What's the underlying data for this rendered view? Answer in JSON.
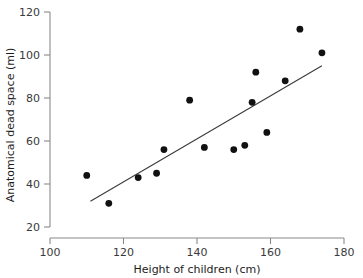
{
  "chart_data": {
    "type": "scatter",
    "title": "",
    "xlabel": "Height of children (cm)",
    "ylabel": "Anatomical dead space (ml)",
    "xlim": [
      100,
      180
    ],
    "ylim": [
      20,
      120
    ],
    "xticks": [
      100,
      120,
      140,
      160,
      180
    ],
    "yticks": [
      20,
      40,
      60,
      80,
      100,
      120
    ],
    "xtick_labels": [
      "100",
      "120",
      "140",
      "160",
      "180"
    ],
    "ytick_labels": [
      "20",
      "40",
      "60",
      "80",
      "100",
      "120"
    ],
    "grid": false,
    "legend": null,
    "x": [
      110,
      116,
      124,
      129,
      131,
      138,
      142,
      150,
      153,
      155,
      156,
      159,
      164,
      168,
      174
    ],
    "y": [
      44,
      31,
      43,
      45,
      56,
      79,
      57,
      56,
      58,
      78,
      92,
      64,
      88,
      112,
      101
    ],
    "points": [
      {
        "x": 110,
        "y": 44
      },
      {
        "x": 116,
        "y": 31
      },
      {
        "x": 124,
        "y": 43
      },
      {
        "x": 129,
        "y": 45
      },
      {
        "x": 131,
        "y": 56
      },
      {
        "x": 138,
        "y": 79
      },
      {
        "x": 142,
        "y": 57
      },
      {
        "x": 150,
        "y": 56
      },
      {
        "x": 153,
        "y": 58
      },
      {
        "x": 155,
        "y": 78
      },
      {
        "x": 156,
        "y": 92
      },
      {
        "x": 159,
        "y": 64
      },
      {
        "x": 164,
        "y": 88
      },
      {
        "x": 168,
        "y": 112
      },
      {
        "x": 174,
        "y": 101
      }
    ],
    "trendline": {
      "type": "linear-fit",
      "x_start": 111,
      "y_start": 32,
      "x_end": 174,
      "y_end": 95
    },
    "marker": {
      "shape": "circle",
      "size_px": 3.4,
      "color": "#111111"
    },
    "colors": {
      "point": "#111111",
      "line": "#3b3b3b",
      "axis": "#8a8a8a",
      "tick_text": "#3a3a3a",
      "title_text": "#1c1c1c",
      "background": "#ffffff"
    }
  }
}
